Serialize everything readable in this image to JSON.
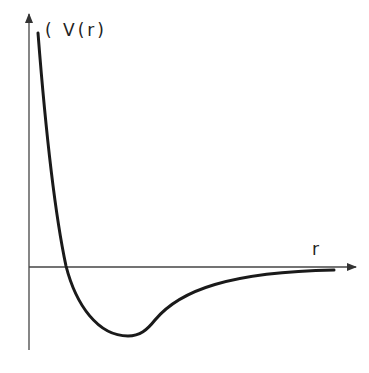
{
  "diagram": {
    "y_axis_label": "( V(r)",
    "x_axis_label": "r",
    "curve_description": "Potential energy V(r) vs separation r: steep repulsive wall, crosses zero, well minimum, asymptotically approaches zero",
    "colors": {
      "ink": "#1a1a1a",
      "axis": "#444444",
      "background": "#ffffff"
    }
  }
}
